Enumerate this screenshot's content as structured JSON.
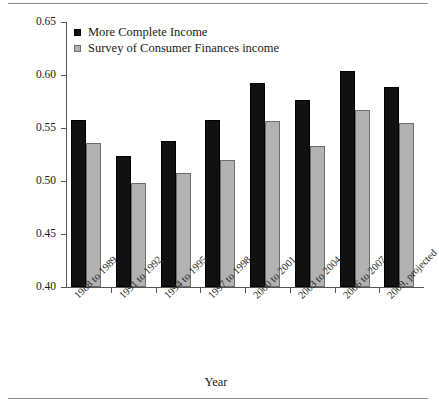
{
  "chart_data": {
    "type": "bar",
    "title": "",
    "xlabel": "Year",
    "ylabel": "Gini Index",
    "ylim": [
      0.4,
      0.65
    ],
    "yticks": [
      "0.40",
      "0.45",
      "0.50",
      "0.55",
      "0.60",
      "0.65"
    ],
    "ytick_values": [
      0.4,
      0.45,
      0.5,
      0.55,
      0.6,
      0.65
    ],
    "grid": false,
    "legend_position": "top-left",
    "categories": [
      "1988 to 1989",
      "1991 to 1992",
      "1994 to 1995",
      "1997 to 1998",
      "2000 to 2001",
      "2003 to 2004",
      "2006 to 2007",
      "2009, projected"
    ],
    "series": [
      {
        "name": "More Complete Income",
        "color": "#111111",
        "values": [
          0.558,
          0.524,
          0.538,
          0.558,
          0.592,
          0.576,
          0.604,
          0.589
        ]
      },
      {
        "name": "Survey of Consumer Finances income",
        "color": "#b2b2b2",
        "values": [
          0.536,
          0.498,
          0.508,
          0.52,
          0.557,
          0.533,
          0.567,
          0.555
        ]
      }
    ]
  }
}
